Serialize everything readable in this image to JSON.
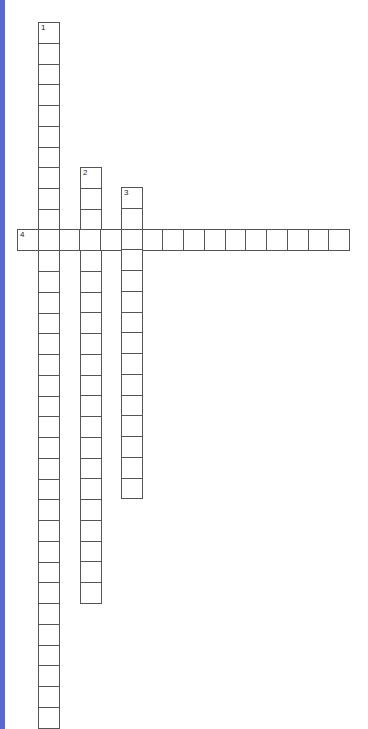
{
  "puzzle": {
    "type": "crossword",
    "cell_size": 20.75,
    "accent_color": "#5a68d2",
    "entries": [
      {
        "number": "1",
        "direction": "down",
        "x": 38,
        "y": 22,
        "length": 34
      },
      {
        "number": "2",
        "direction": "down",
        "x": 80,
        "y": 167,
        "length": 21
      },
      {
        "number": "3",
        "direction": "down",
        "x": 121,
        "y": 187,
        "length": 15
      },
      {
        "number": "4",
        "direction": "across",
        "x": 17,
        "y": 229,
        "length": 16
      }
    ]
  }
}
